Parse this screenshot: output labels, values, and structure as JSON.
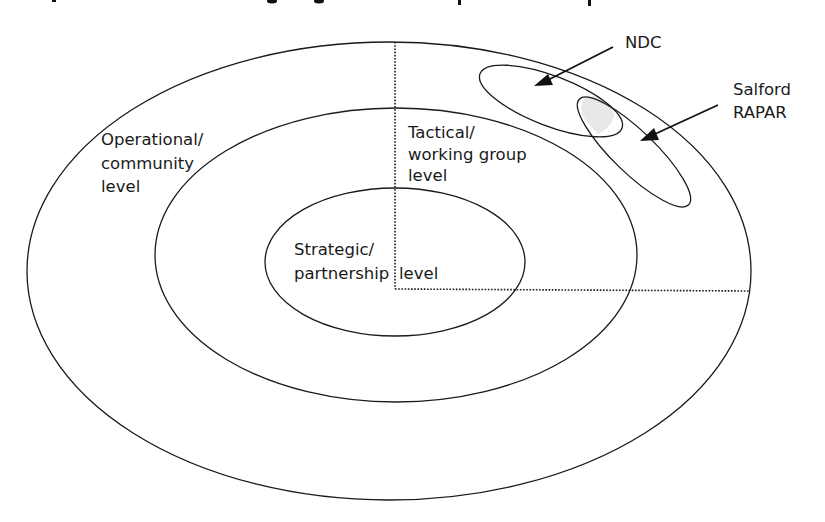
{
  "diagram": {
    "levels": {
      "operational": {
        "line1": "Operational/",
        "line2": "community",
        "line3": "level"
      },
      "tactical": {
        "line1": "Tactical/",
        "line2": "working group",
        "line3": "level"
      },
      "strategic": {
        "line1": "Strategic/",
        "line2a": "partnership",
        "line2b": "level"
      }
    },
    "callouts": {
      "ndc": {
        "label": "NDC"
      },
      "salford": {
        "line1": "Salford",
        "line2": "RAPAR"
      }
    },
    "colors": {
      "stroke": "#1a1a1a",
      "background": "#ffffff",
      "overlap_fill": "#e8e8e8"
    }
  }
}
